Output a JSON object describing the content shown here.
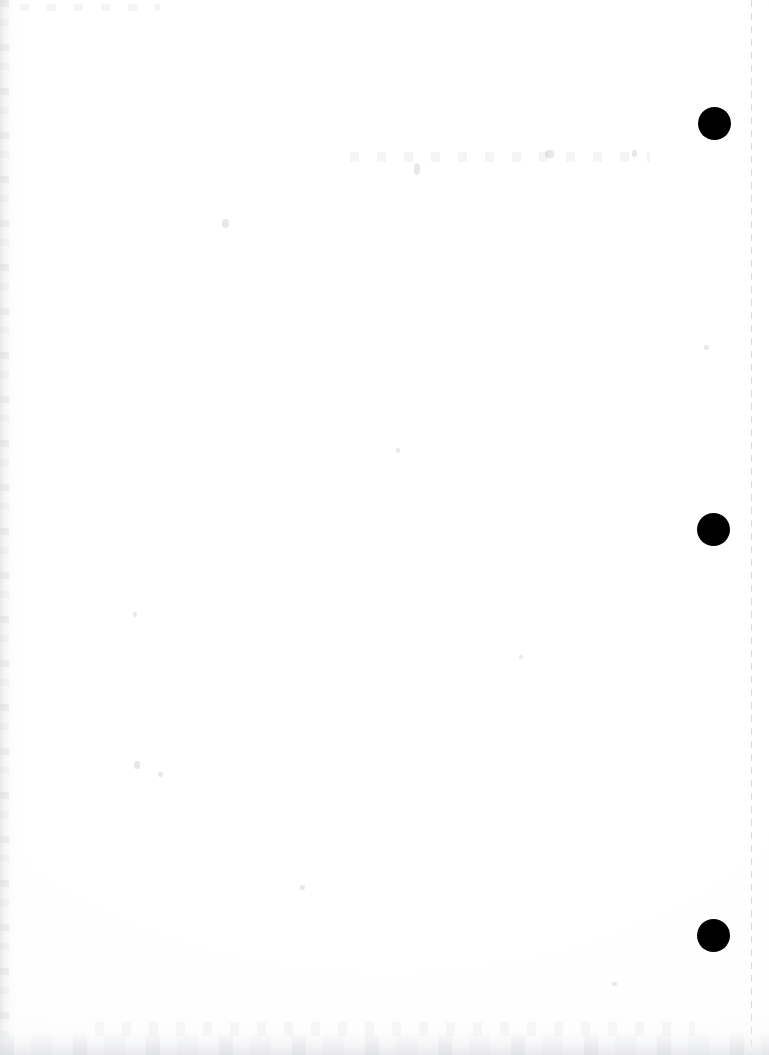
{
  "document": {
    "kind": "scanned-page",
    "page_side": "blank",
    "width": 769,
    "height": 1055,
    "background_color": "#ffffff",
    "ink_color": "#000000",
    "visible_text": "",
    "notes_label": ""
  },
  "registration_marks": {
    "name": "registration-dots",
    "count": 3,
    "color": "#000000",
    "diameter": 33,
    "items": [
      {
        "index": 1,
        "cx": 714,
        "cy": 123,
        "r": 16.5
      },
      {
        "index": 2,
        "cx": 713,
        "cy": 529,
        "r": 16.5
      },
      {
        "index": 3,
        "cx": 713,
        "cy": 935,
        "r": 16.5
      }
    ]
  },
  "margin_rule": {
    "name": "dashed-margin-rule",
    "orientation": "vertical",
    "x": 751,
    "color": "#d8dadd",
    "thickness": 1,
    "dash": 7,
    "gap": 6
  },
  "scan_artifacts": {
    "left_edge_streak": {
      "x": 0,
      "width": 26,
      "color": "#e1e2e4"
    },
    "bottom_edge_shadow": {
      "y": 1009,
      "height": 46,
      "color": "#e4e5e7"
    },
    "specks": [
      {
        "x": 222,
        "y": 219,
        "w": 7,
        "h": 9
      },
      {
        "x": 414,
        "y": 163,
        "w": 6,
        "h": 12
      },
      {
        "x": 545,
        "y": 150,
        "w": 9,
        "h": 8
      },
      {
        "x": 632,
        "y": 150,
        "w": 5,
        "h": 7
      },
      {
        "x": 134,
        "y": 761,
        "w": 6,
        "h": 8
      },
      {
        "x": 158,
        "y": 772,
        "w": 5,
        "h": 5
      },
      {
        "x": 396,
        "y": 448,
        "w": 4,
        "h": 5
      },
      {
        "x": 704,
        "y": 345,
        "w": 5,
        "h": 5
      },
      {
        "x": 519,
        "y": 655,
        "w": 4,
        "h": 4
      },
      {
        "x": 133,
        "y": 612,
        "w": 4,
        "h": 5
      },
      {
        "x": 300,
        "y": 885,
        "w": 5,
        "h": 5
      },
      {
        "x": 612,
        "y": 982,
        "w": 5,
        "h": 4
      }
    ],
    "ghost_bands": [
      {
        "x": 20,
        "y": 4,
        "w": 140,
        "h": 7
      },
      {
        "x": 350,
        "y": 152,
        "w": 300,
        "h": 10
      },
      {
        "x": 95,
        "y": 1022,
        "w": 600,
        "h": 14
      }
    ]
  }
}
